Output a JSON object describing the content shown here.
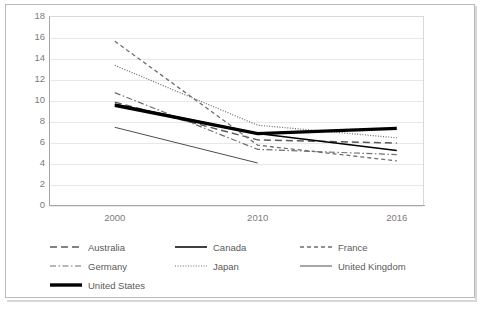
{
  "chart_data": {
    "type": "line",
    "title": "",
    "subtitle": "",
    "xlabel": "",
    "ylabel": "",
    "x": [
      "2000",
      "2010",
      "2016"
    ],
    "categories": [
      "2000",
      "2010",
      "2016"
    ],
    "ylim": [
      0,
      18
    ],
    "ytick_step": 2,
    "yticks": [
      "18",
      "16",
      "14",
      "12",
      "10",
      "8",
      "6",
      "4",
      "2",
      "0"
    ],
    "grid": true,
    "grid_axis": "y",
    "legend_position": "bottom",
    "series": [
      {
        "name": "Australia",
        "values": [
          9.8,
          6.2,
          5.9
        ],
        "style": "long-dash",
        "color": "#595959",
        "width": 1.4
      },
      {
        "name": "Canada",
        "values": [
          9.6,
          6.8,
          5.2
        ],
        "style": "solid",
        "color": "#000000",
        "width": 1.5
      },
      {
        "name": "France",
        "values": [
          15.6,
          5.7,
          4.2
        ],
        "style": "short-dash",
        "color": "#6e6e6e",
        "width": 1.3
      },
      {
        "name": "Germany",
        "values": [
          10.7,
          5.3,
          4.8
        ],
        "style": "dash-dot",
        "color": "#707070",
        "width": 1.2
      },
      {
        "name": "Japan",
        "values": [
          13.3,
          7.6,
          6.4
        ],
        "style": "dotted",
        "color": "#6b6b6b",
        "width": 1.2
      },
      {
        "name": "United Kingdom",
        "values": [
          7.4,
          4.0,
          null
        ],
        "style": "thin-solid",
        "color": "#4d4d4d",
        "width": 1.0
      },
      {
        "name": "United States",
        "values": [
          9.5,
          6.8,
          7.3
        ],
        "style": "thick-solid",
        "color": "#000000",
        "width": 3.4
      }
    ]
  },
  "legend": {
    "rows": [
      [
        "Australia",
        "Canada",
        "France"
      ],
      [
        "Germany",
        "Japan",
        "United Kingdom"
      ],
      [
        "United States"
      ]
    ]
  }
}
